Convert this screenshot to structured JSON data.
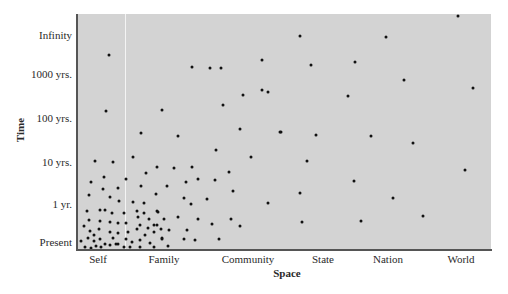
{
  "chart_data": {
    "type": "scatter",
    "title": "",
    "xlabel": "Space",
    "ylabel": "Time",
    "x_categories": [
      "Self",
      "Family",
      "Community",
      "State",
      "Nation",
      "World"
    ],
    "y_categories": [
      "Present",
      "1 yr.",
      "10 yrs.",
      "100 yrs.",
      "1000 yrs.",
      "Infinity"
    ],
    "grid": false,
    "legend": null,
    "plot_background": "#d3d3d3",
    "point_color": "#111111",
    "note": "Points are given as pixel coordinates [x, y] in the 508x294 image; x-axis spans Self..World, y-axis spans Present (bottom) .. Infinity (top). Density is highest near Self/Present.",
    "points_px": [
      [
        109,
        55
      ],
      [
        106,
        111
      ],
      [
        162,
        110
      ],
      [
        141,
        133
      ],
      [
        133,
        157
      ],
      [
        95,
        161
      ],
      [
        113,
        162
      ],
      [
        157,
        167
      ],
      [
        146,
        173
      ],
      [
        104,
        177
      ],
      [
        91,
        182
      ],
      [
        126,
        179
      ],
      [
        141,
        186
      ],
      [
        103,
        189
      ],
      [
        118,
        188
      ],
      [
        89,
        195
      ],
      [
        110,
        197
      ],
      [
        156,
        194
      ],
      [
        119,
        201
      ],
      [
        133,
        202
      ],
      [
        144,
        203
      ],
      [
        87,
        211
      ],
      [
        100,
        210
      ],
      [
        105,
        210
      ],
      [
        112,
        213
      ],
      [
        124,
        213
      ],
      [
        137,
        211
      ],
      [
        157,
        211
      ],
      [
        89,
        220
      ],
      [
        100,
        221
      ],
      [
        110,
        222
      ],
      [
        118,
        223
      ],
      [
        126,
        223
      ],
      [
        138,
        217
      ],
      [
        144,
        213
      ],
      [
        149,
        219
      ],
      [
        84,
        226
      ],
      [
        99,
        229
      ],
      [
        140,
        225
      ],
      [
        148,
        228
      ],
      [
        154,
        225
      ],
      [
        90,
        231
      ],
      [
        94,
        235
      ],
      [
        110,
        232
      ],
      [
        118,
        233
      ],
      [
        128,
        232
      ],
      [
        137,
        229
      ],
      [
        145,
        235
      ],
      [
        154,
        232
      ],
      [
        161,
        229
      ],
      [
        81,
        241
      ],
      [
        88,
        238
      ],
      [
        94,
        241
      ],
      [
        100,
        239
      ],
      [
        105,
        244
      ],
      [
        113,
        238
      ],
      [
        118,
        244
      ],
      [
        126,
        239
      ],
      [
        132,
        242
      ],
      [
        140,
        240
      ],
      [
        150,
        243
      ],
      [
        162,
        238
      ],
      [
        85,
        247
      ],
      [
        91,
        248
      ],
      [
        96,
        246
      ],
      [
        101,
        247
      ],
      [
        110,
        245
      ],
      [
        116,
        244
      ],
      [
        124,
        247
      ],
      [
        130,
        247
      ],
      [
        140,
        247
      ],
      [
        154,
        247
      ],
      [
        174,
        168
      ],
      [
        192,
        167
      ],
      [
        198,
        179
      ],
      [
        186,
        182
      ],
      [
        215,
        180
      ],
      [
        167,
        186
      ],
      [
        184,
        198
      ],
      [
        191,
        204
      ],
      [
        207,
        199
      ],
      [
        158,
        212
      ],
      [
        164,
        219
      ],
      [
        178,
        217
      ],
      [
        198,
        219
      ],
      [
        157,
        225
      ],
      [
        169,
        230
      ],
      [
        187,
        230
      ],
      [
        212,
        224
      ],
      [
        162,
        239
      ],
      [
        184,
        239
      ],
      [
        195,
        240
      ],
      [
        219,
        239
      ],
      [
        168,
        246
      ],
      [
        178,
        136
      ],
      [
        192,
        67
      ],
      [
        210,
        68
      ],
      [
        221,
        68
      ],
      [
        262,
        60
      ],
      [
        262,
        90
      ],
      [
        268,
        92
      ],
      [
        243,
        95
      ],
      [
        223,
        105
      ],
      [
        240,
        129
      ],
      [
        280,
        132
      ],
      [
        216,
        150
      ],
      [
        251,
        157
      ],
      [
        229,
        172
      ],
      [
        233,
        191
      ],
      [
        268,
        203
      ],
      [
        231,
        219
      ],
      [
        240,
        226
      ],
      [
        300,
        36
      ],
      [
        311,
        65
      ],
      [
        281,
        132
      ],
      [
        316,
        135
      ],
      [
        307,
        161
      ],
      [
        300,
        193
      ],
      [
        302,
        222
      ],
      [
        386,
        37
      ],
      [
        355,
        62
      ],
      [
        348,
        96
      ],
      [
        371,
        136
      ],
      [
        354,
        181
      ],
      [
        393,
        198
      ],
      [
        361,
        221
      ],
      [
        458,
        16
      ],
      [
        404,
        80
      ],
      [
        473,
        88
      ],
      [
        413,
        143
      ],
      [
        465,
        170
      ],
      [
        423,
        216
      ]
    ]
  },
  "axes": {
    "x": {
      "title": "Space",
      "ticks": [
        {
          "label": "Self",
          "x": 98
        },
        {
          "label": "Family",
          "x": 164
        },
        {
          "label": "Community",
          "x": 248
        },
        {
          "label": "State",
          "x": 323
        },
        {
          "label": "Nation",
          "x": 388
        },
        {
          "label": "World",
          "x": 461
        }
      ]
    },
    "y": {
      "title": "Time",
      "ticks": [
        {
          "label": "Infinity",
          "y": 35
        },
        {
          "label": "1000 yrs.",
          "y": 74
        },
        {
          "label": "100 yrs.",
          "y": 118
        },
        {
          "label": "10 yrs.",
          "y": 162
        },
        {
          "label": "1 yr.",
          "y": 204
        },
        {
          "label": "Present",
          "y": 242
        }
      ]
    }
  },
  "decor": {
    "divider_x": 125
  }
}
